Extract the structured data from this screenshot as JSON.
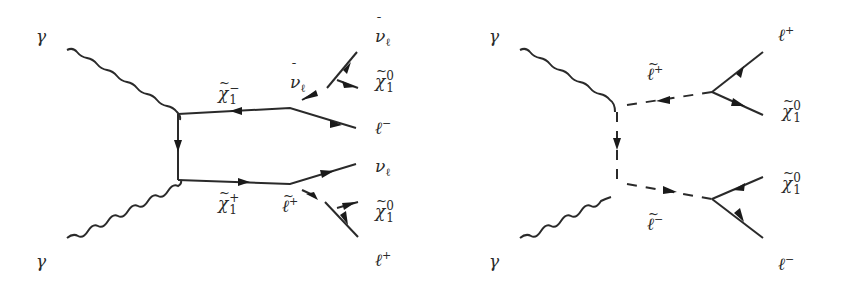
{
  "figure": {
    "colors": {
      "line": "#2a2a2a",
      "background": "#ffffff"
    }
  },
  "diagram_left": {
    "incoming": {
      "top_photon": "γ",
      "bottom_photon": "γ"
    },
    "propagators": {
      "top_chargino": {
        "base": "χ",
        "decor": "~",
        "sup": "−",
        "sub": "1"
      },
      "bottom_chargino": {
        "base": "χ",
        "decor": "~",
        "sup": "+",
        "sub": "1"
      }
    },
    "intermediate": {
      "top_sneutrino": {
        "base": "ν",
        "decor": "¯",
        "sub": "ℓ"
      },
      "bottom_slepton": {
        "base": "ℓ",
        "decor": "~",
        "sup": "+"
      }
    },
    "outgoing": {
      "top_antineutrino": {
        "base": "ν",
        "decor": "¯",
        "sub": "ℓ"
      },
      "top_neutralino": {
        "base": "χ",
        "decor": "~",
        "sup": "0",
        "sub": "1"
      },
      "top_lepton": {
        "base": "ℓ",
        "sup": "−"
      },
      "bottom_neutrino": {
        "base": "ν",
        "sub": "ℓ"
      },
      "bottom_neutralino": {
        "base": "χ",
        "decor": "~",
        "sup": "0",
        "sub": "1"
      },
      "bottom_lepton": {
        "base": "ℓ",
        "sup": "+"
      }
    }
  },
  "diagram_right": {
    "incoming": {
      "top_photon": "γ",
      "bottom_photon": "γ"
    },
    "propagators": {
      "top_slepton": {
        "base": "ℓ",
        "decor": "~",
        "sup": "+"
      },
      "bottom_slepton": {
        "base": "ℓ",
        "decor": "~",
        "sup": "−"
      }
    },
    "outgoing": {
      "top_lepton": {
        "base": "ℓ",
        "sup": "+"
      },
      "top_neutralino": {
        "base": "χ",
        "decor": "~",
        "sup": "0",
        "sub": "1"
      },
      "bottom_neutralino": {
        "base": "χ",
        "decor": "~",
        "sup": "0",
        "sub": "1"
      },
      "bottom_lepton": {
        "base": "ℓ",
        "sup": "−"
      }
    }
  }
}
